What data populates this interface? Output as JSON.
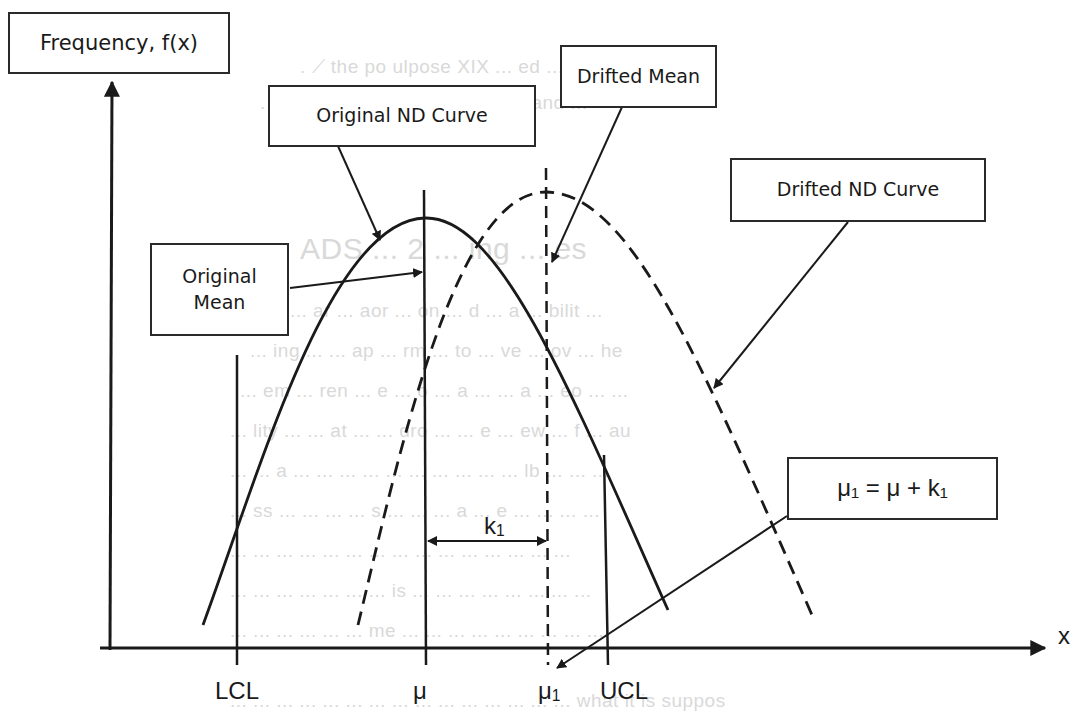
{
  "diagram": {
    "type": "process-control-normal-distribution-drift",
    "y_axis_label": "Frequency, f(x)",
    "x_axis_label": "x",
    "callouts": {
      "original_curve": "Original ND Curve",
      "drifted_mean": "Drifted Mean",
      "drifted_curve": "Drifted ND Curve",
      "original_mean_line1": "Original",
      "original_mean_line2": "Mean",
      "relation": "μ₁ = μ + k₁"
    },
    "x_ticks": {
      "lcl": "LCL",
      "mu": "μ",
      "mu1_base": "μ",
      "mu1_sub": "1",
      "ucl": "UCL"
    },
    "shift": {
      "label_base": "k",
      "label_sub": "1"
    },
    "curves": [
      {
        "name": "Original ND Curve",
        "style": "solid",
        "mean": "μ"
      },
      {
        "name": "Drifted ND Curve",
        "style": "dashed",
        "mean": "μ1"
      }
    ],
    "colors": {
      "line": "#1a1a1a",
      "background": "#ffffff",
      "ghost_text": "#d9d9d9"
    }
  }
}
